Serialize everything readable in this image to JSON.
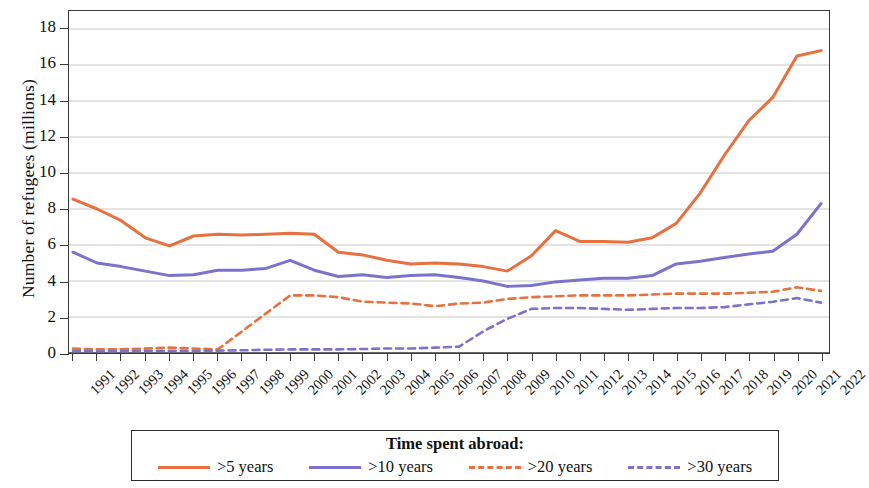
{
  "chart_data": {
    "type": "line",
    "title": "",
    "xlabel": "",
    "ylabel": "Number of refugees (millions)",
    "ylim": [
      0,
      19
    ],
    "xlim": [
      1991,
      2022
    ],
    "yticks": [
      0,
      2,
      4,
      6,
      8,
      10,
      12,
      14,
      16,
      18
    ],
    "grid": true,
    "legend_position": "bottom",
    "legend_title": "Time spent abroad:",
    "x": [
      1991,
      1992,
      1993,
      1994,
      1995,
      1996,
      1997,
      1998,
      1999,
      2000,
      2001,
      2002,
      2003,
      2004,
      2005,
      2006,
      2007,
      2008,
      2009,
      2010,
      2011,
      2012,
      2013,
      2014,
      2015,
      2016,
      2017,
      2018,
      2019,
      2020,
      2021,
      2022
    ],
    "categories": [
      "1991",
      "1992",
      "1993",
      "1994",
      "1995",
      "1996",
      "1997",
      "1998",
      "1999",
      "2000",
      "2001",
      "2002",
      "2003",
      "2004",
      "2005",
      "2006",
      "2007",
      "2008",
      "2009",
      "2010",
      "2011",
      "2012",
      "2013",
      "2014",
      "2015",
      "2016",
      "2017",
      "2018",
      "2019",
      "2020",
      "2021",
      "2022"
    ],
    "series": [
      {
        "name": ">5 years",
        "color": "#E8703F",
        "style": "solid",
        "values": [
          8.55,
          8.0,
          7.35,
          6.4,
          5.95,
          6.5,
          6.6,
          6.55,
          6.6,
          6.65,
          6.6,
          5.6,
          5.45,
          5.15,
          4.95,
          5.0,
          4.95,
          4.8,
          4.55,
          5.4,
          6.8,
          6.2,
          6.2,
          6.15,
          6.4,
          7.2,
          8.9,
          11.0,
          12.9,
          14.2,
          16.5,
          16.8
        ]
      },
      {
        "name": ">10 years",
        "color": "#7B72CC",
        "style": "solid",
        "values": [
          5.6,
          5.0,
          4.8,
          4.55,
          4.3,
          4.35,
          4.6,
          4.6,
          4.7,
          5.15,
          4.6,
          4.25,
          4.35,
          4.2,
          4.3,
          4.35,
          4.2,
          4.0,
          3.7,
          3.75,
          3.95,
          4.05,
          4.15,
          4.15,
          4.3,
          4.95,
          5.1,
          5.3,
          5.5,
          5.65,
          6.6,
          8.3
        ]
      },
      {
        "name": ">20 years",
        "color": "#E8703F",
        "style": "dashed",
        "values": [
          0.25,
          0.2,
          0.2,
          0.25,
          0.3,
          0.25,
          0.2,
          1.2,
          2.2,
          3.2,
          3.2,
          3.1,
          2.85,
          2.8,
          2.75,
          2.6,
          2.75,
          2.8,
          3.0,
          3.1,
          3.15,
          3.2,
          3.2,
          3.2,
          3.25,
          3.3,
          3.3,
          3.3,
          3.35,
          3.4,
          3.65,
          3.45
        ]
      },
      {
        "name": ">30 years",
        "color": "#7B72CC",
        "style": "dashed",
        "values": [
          0.12,
          0.1,
          0.1,
          0.12,
          0.12,
          0.12,
          0.13,
          0.15,
          0.18,
          0.2,
          0.2,
          0.2,
          0.22,
          0.25,
          0.25,
          0.3,
          0.35,
          1.2,
          1.9,
          2.45,
          2.5,
          2.5,
          2.45,
          2.4,
          2.45,
          2.5,
          2.5,
          2.55,
          2.7,
          2.85,
          3.05,
          2.8
        ]
      }
    ]
  },
  "axes": {
    "ylabel": "Number of refugees (millions)",
    "ytick_labels": [
      "0",
      "2",
      "4",
      "6",
      "8",
      "10",
      "12",
      "14",
      "16",
      "18"
    ],
    "xtick_labels": [
      "1991",
      "1992",
      "1993",
      "1994",
      "1995",
      "1996",
      "1997",
      "1998",
      "1999",
      "2000",
      "2001",
      "2002",
      "2003",
      "2004",
      "2005",
      "2006",
      "2007",
      "2008",
      "2009",
      "2010",
      "2011",
      "2012",
      "2013",
      "2014",
      "2015",
      "2016",
      "2017",
      "2018",
      "2019",
      "2020",
      "2021",
      "2022"
    ]
  },
  "legend": {
    "title": "Time spent abroad:",
    "items": [
      {
        "label": ">5 years",
        "color": "#E8703F",
        "style": "solid"
      },
      {
        "label": ">10 years",
        "color": "#7B72CC",
        "style": "solid"
      },
      {
        "label": ">20 years",
        "color": "#E8703F",
        "style": "dashed"
      },
      {
        "label": ">30 years",
        "color": "#7B72CC",
        "style": "dashed"
      }
    ]
  },
  "colors": {
    "orange": "#E8703F",
    "blue": "#7B72CC",
    "axis": "#3a3a3a",
    "grid": "#b9b9b9"
  }
}
